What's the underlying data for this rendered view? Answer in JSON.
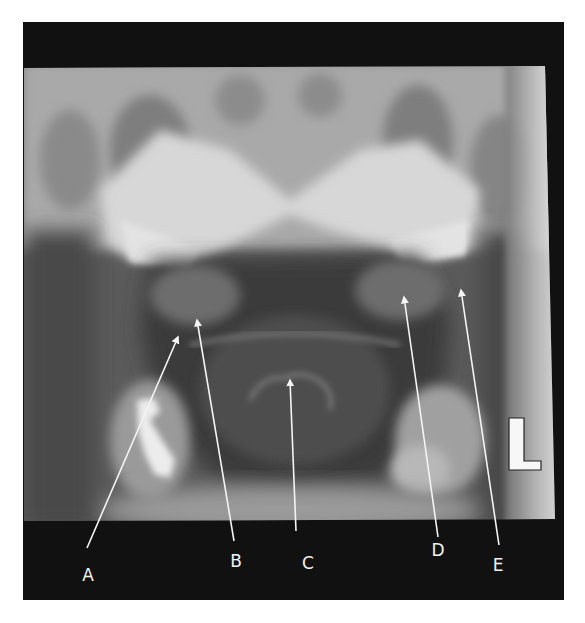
{
  "figure": {
    "side_marker": "L",
    "colors": {
      "frame": "#111111",
      "arrow": "#f4f4f4",
      "label": "#f2f2f2",
      "marker_fill": "#f7f7f7",
      "marker_stroke": "#222222"
    }
  },
  "annotations": [
    {
      "label": "A",
      "tip": [
        178,
        337
      ],
      "tail": [
        87,
        548
      ],
      "label_pos": [
        88,
        575
      ]
    },
    {
      "label": "B",
      "tip": [
        197,
        320
      ],
      "tail": [
        234,
        541
      ],
      "label_pos": [
        236,
        561
      ]
    },
    {
      "label": "C",
      "tip": [
        290,
        380
      ],
      "tail": [
        296,
        531
      ],
      "label_pos": [
        308,
        563
      ]
    },
    {
      "label": "D",
      "tip": [
        404,
        297
      ],
      "tail": [
        438,
        537
      ],
      "label_pos": [
        438,
        550
      ]
    },
    {
      "label": "E",
      "tip": [
        461,
        290
      ],
      "tail": [
        499,
        545
      ],
      "label_pos": [
        498,
        565
      ]
    }
  ]
}
